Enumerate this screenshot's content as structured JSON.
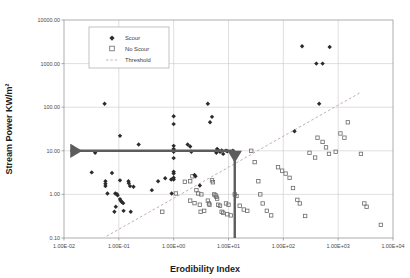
{
  "chart_data": {
    "type": "scatter",
    "title": "",
    "xlabel": "Erodibility Index",
    "ylabel": "Stream Power KW/m²",
    "xscale": "log",
    "yscale": "log",
    "xlim": [
      0.01,
      10000
    ],
    "ylim": [
      0.1,
      10000
    ],
    "grid": true,
    "xticklabels": [
      "1.00E-02",
      "1.00E-01",
      "1.00E+00",
      "1.00E+01",
      "1.00E+02",
      "1.00E+03",
      "1.00E+04"
    ],
    "xtickvalues": [
      0.01,
      0.1,
      1,
      10,
      100,
      1000,
      10000
    ],
    "yticklabels": [
      "10000.00",
      "1000.00",
      "100.00",
      "10.00",
      "1.00",
      "0.10"
    ],
    "ytickvalues": [
      10000,
      1000,
      100,
      10,
      1,
      0.1
    ],
    "legend": {
      "position": "top-center",
      "entries": [
        {
          "name": "Scour",
          "marker": "filled-diamond",
          "color": "#2b2b2b"
        },
        {
          "name": "No Scour",
          "marker": "open-square",
          "color": "#6a6a6a"
        },
        {
          "name": "Threshold",
          "marker": "dashed-line",
          "color": "#b9a6a6"
        }
      ]
    },
    "series": [
      {
        "name": "Scour",
        "marker": "filled-diamond",
        "color": "#2b2b2b",
        "points": [
          [
            0.055,
            120
          ],
          [
            0.105,
            22
          ],
          [
            0.23,
            14
          ],
          [
            0.037,
            9.0
          ],
          [
            0.032,
            3.2
          ],
          [
            0.075,
            3.1
          ],
          [
            0.057,
            2.0
          ],
          [
            0.057,
            1.75
          ],
          [
            0.057,
            1.55
          ],
          [
            0.062,
            1.05
          ],
          [
            0.105,
            2.1
          ],
          [
            0.15,
            2.0
          ],
          [
            0.152,
            1.8
          ],
          [
            0.16,
            1.55
          ],
          [
            0.185,
            1.5
          ],
          [
            0.086,
            1.05
          ],
          [
            0.092,
            1.02
          ],
          [
            0.095,
            0.95
          ],
          [
            0.105,
            0.78
          ],
          [
            0.108,
            0.72
          ],
          [
            0.112,
            0.68
          ],
          [
            0.12,
            0.63
          ],
          [
            0.088,
            0.52
          ],
          [
            0.122,
            0.42
          ],
          [
            0.165,
            0.4
          ],
          [
            0.083,
            0.4
          ],
          [
            0.4,
            1.25
          ],
          [
            0.52,
            2.0
          ],
          [
            0.7,
            2.35
          ],
          [
            0.9,
            2.2
          ],
          [
            0.92,
            1.05
          ],
          [
            1.0,
            62
          ],
          [
            1.0,
            41
          ],
          [
            1.0,
            13
          ],
          [
            1.0,
            11
          ],
          [
            1.0,
            10.5
          ],
          [
            1.0,
            9.5
          ],
          [
            1.0,
            6.8
          ],
          [
            1.0,
            3.3
          ],
          [
            1.0,
            3.0
          ],
          [
            1.0,
            2.4
          ],
          [
            1.0,
            2.2
          ],
          [
            1.8,
            14
          ],
          [
            2.0,
            12.5
          ],
          [
            2.1,
            9.5
          ],
          [
            2.4,
            2.8
          ],
          [
            2.5,
            2.6
          ],
          [
            3.0,
            1.6
          ],
          [
            4.2,
            120
          ],
          [
            5.0,
            60
          ],
          [
            4.6,
            45
          ],
          [
            6.2,
            11
          ],
          [
            6.5,
            10.3
          ],
          [
            7.5,
            10.2
          ],
          [
            9.0,
            10.1
          ],
          [
            7.0,
            9.5
          ],
          [
            6.0,
            9.0
          ],
          [
            8.0,
            8.5
          ],
          [
            9.5,
            9.8
          ],
          [
            12,
            10.0
          ],
          [
            220,
            2500
          ],
          [
            700,
            2400
          ],
          [
            400,
            1000
          ],
          [
            520,
            1000
          ],
          [
            450,
            120
          ],
          [
            160,
            28
          ]
        ]
      },
      {
        "name": "No Scour",
        "marker": "open-square",
        "color": "#6a6a6a",
        "points": [
          [
            0.62,
            0.4
          ],
          [
            1.1,
            1.05
          ],
          [
            1.6,
            1.95
          ],
          [
            2.0,
            2.0
          ],
          [
            2.2,
            2.6
          ],
          [
            2.6,
            1.25
          ],
          [
            2.8,
            1.05
          ],
          [
            3.2,
            1.0
          ],
          [
            2.0,
            0.72
          ],
          [
            2.4,
            0.63
          ],
          [
            3.0,
            0.58
          ],
          [
            3.1,
            0.4
          ],
          [
            3.6,
            0.42
          ],
          [
            4.2,
            0.72
          ],
          [
            4.4,
            0.62
          ],
          [
            4.5,
            0.58
          ],
          [
            5.0,
            2.1
          ],
          [
            5.2,
            1.9
          ],
          [
            5.5,
            1.0
          ],
          [
            5.8,
            0.95
          ],
          [
            6.0,
            0.88
          ],
          [
            6.2,
            0.8
          ],
          [
            6.5,
            0.58
          ],
          [
            7.0,
            0.55
          ],
          [
            7.5,
            0.4
          ],
          [
            8.0,
            0.38
          ],
          [
            9.5,
            0.35
          ],
          [
            9.0,
            0.62
          ],
          [
            10,
            0.58
          ],
          [
            11,
            0.33
          ],
          [
            13,
            1.0
          ],
          [
            14,
            0.92
          ],
          [
            16,
            0.55
          ],
          [
            19,
            0.45
          ],
          [
            22,
            0.42
          ],
          [
            26,
            10.0
          ],
          [
            30,
            5.5
          ],
          [
            35,
            2.0
          ],
          [
            38,
            1.0
          ],
          [
            42,
            0.62
          ],
          [
            50,
            0.42
          ],
          [
            60,
            0.33
          ],
          [
            80,
            4.2
          ],
          [
            95,
            3.5
          ],
          [
            110,
            3.0
          ],
          [
            130,
            2.4
          ],
          [
            150,
            1.4
          ],
          [
            180,
            0.75
          ],
          [
            200,
            0.62
          ],
          [
            250,
            0.32
          ],
          [
            300,
            9.0
          ],
          [
            380,
            7.0
          ],
          [
            420,
            20
          ],
          [
            520,
            16
          ],
          [
            600,
            12
          ],
          [
            680,
            8.5
          ],
          [
            900,
            9.5
          ],
          [
            1100,
            25
          ],
          [
            1300,
            20
          ],
          [
            1500,
            45
          ],
          [
            2600,
            8.5
          ],
          [
            3000,
            0.62
          ],
          [
            3300,
            0.52
          ],
          [
            6000,
            0.2
          ]
        ]
      }
    ],
    "threshold_line": {
      "name": "Threshold",
      "style": "dashed",
      "color": "#c4afaf",
      "x1": 0.06,
      "y1": 0.11,
      "x2": 2600,
      "y2": 220
    },
    "annotations": [
      {
        "name": "horizontal-arrow",
        "type": "arrow",
        "direction": "left",
        "color": "#5c5c5c",
        "y": 10.0,
        "x_from": 13,
        "x_to": 0.013,
        "label": ""
      },
      {
        "name": "vertical-arrow",
        "type": "arrow",
        "direction": "up",
        "color": "#5c5c5c",
        "x": 13,
        "y_from": 0.1,
        "y_to": 10.0,
        "label": ""
      }
    ]
  }
}
